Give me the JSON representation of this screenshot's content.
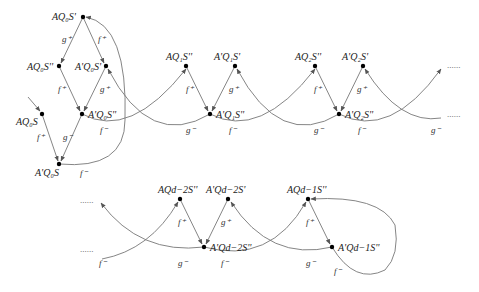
{
  "diagram": {
    "nodes": [
      {
        "id": "AQ0S1",
        "label": "AQ₀S'",
        "x": 83,
        "y": 17
      },
      {
        "id": "AQ0S2",
        "label": "AQ₀S''",
        "x": 59,
        "y": 66
      },
      {
        "id": "ApQ0S1",
        "label": "A'Q₀S'",
        "x": 106,
        "y": 66
      },
      {
        "id": "AQ0S",
        "label": "AQ₀S",
        "x": 42,
        "y": 114
      },
      {
        "id": "ApQ0S2",
        "label": "A'Q₀S''",
        "x": 82,
        "y": 114
      },
      {
        "id": "ApQ0S",
        "label": "A'Q₀S",
        "x": 59,
        "y": 164
      },
      {
        "id": "AQ1S2",
        "label": "AQ₁S''",
        "x": 186,
        "y": 66
      },
      {
        "id": "ApQ1S1",
        "label": "A'Q₁S'",
        "x": 235,
        "y": 66
      },
      {
        "id": "ApQ1S2",
        "label": "A'Q₁S''",
        "x": 210,
        "y": 114
      },
      {
        "id": "AQ2S2",
        "label": "AQ₂S''",
        "x": 315,
        "y": 66
      },
      {
        "id": "ApQ2S1",
        "label": "A'Q₂S'",
        "x": 363,
        "y": 66
      },
      {
        "id": "ApQ2S2",
        "label": "A'Q₂S''",
        "x": 339,
        "y": 114
      },
      {
        "id": "AQd2S2",
        "label": "AQd−2S''",
        "x": 180,
        "y": 199
      },
      {
        "id": "ApQd2S1",
        "label": "A'Qd−2S'",
        "x": 228,
        "y": 199
      },
      {
        "id": "ApQd2S2",
        "label": "A'Qd−2S''",
        "x": 204,
        "y": 247
      },
      {
        "id": "AQd1S2",
        "label": "AQd−1S''",
        "x": 308,
        "y": 199
      },
      {
        "id": "ApQd1S2",
        "label": "A'Qd−1S''",
        "x": 332,
        "y": 247
      }
    ],
    "edge_labels": {
      "f_plus": "f⁺",
      "f_minus": "f⁻",
      "g_plus": "g⁺",
      "g_minus": "g⁻"
    },
    "ellipsis": "......"
  }
}
